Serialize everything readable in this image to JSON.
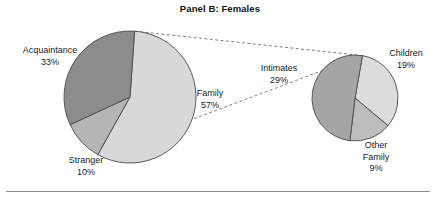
{
  "figure": {
    "title": "Panel B: Females",
    "background": "#ffffff",
    "has_bottom_rule": true
  },
  "chart_data": {
    "type": "pie",
    "title": "Panel B: Females",
    "subtitle": "",
    "xlabel": "",
    "ylabel": "",
    "legend_position": "none",
    "grid": false,
    "charts": [
      {
        "name": "main-pie",
        "role": "overall relationship distribution",
        "center": [
          130,
          97
        ],
        "radius": 66,
        "start_angle_deg": -86,
        "direction": "clockwise",
        "labels": [
          "Family",
          "Stranger",
          "Acquaintance"
        ],
        "values": [
          57,
          10,
          33
        ],
        "units": "%",
        "colors": [
          "#d8d8d8",
          "#b5b5b5",
          "#8c8c8c"
        ],
        "slices": [
          {
            "label": "Family",
            "value": 57,
            "display": "57%",
            "color": "#d8d8d8"
          },
          {
            "label": "Stranger",
            "value": 10,
            "display": "10%",
            "color": "#b5b5b5"
          },
          {
            "label": "Acquaintance",
            "value": 33,
            "display": "33%",
            "color": "#8c8c8c"
          }
        ]
      },
      {
        "name": "family-breakout-pie",
        "role": "breakdown of the Family slice (57%)",
        "center": [
          355,
          98
        ],
        "radius": 43,
        "start_angle_deg": -80,
        "direction": "clockwise",
        "labels": [
          "Children",
          "Other Family",
          "Intimates"
        ],
        "values": [
          19,
          9,
          29
        ],
        "units": "%",
        "colors": [
          "#dcdcdc",
          "#bdbdbd",
          "#a5a5a5"
        ],
        "slices": [
          {
            "label": "Children",
            "value": 19,
            "display": "19%",
            "color": "#dcdcdc"
          },
          {
            "label": "Other Family",
            "value": 9,
            "display": "9%",
            "color": "#bdbdbd"
          },
          {
            "label": "Intimates",
            "value": 29,
            "display": "29%",
            "color": "#a5a5a5"
          }
        ]
      }
    ],
    "connector": {
      "style": "dashed",
      "from_chart": "main-pie",
      "from_slice": "Family",
      "to_chart": "family-breakout-pie",
      "color": "#6e6e6e"
    }
  },
  "labels": {
    "acquaintance": {
      "name": "Acquaintance",
      "pct": "33%"
    },
    "family": {
      "name": "Family",
      "pct": "57%"
    },
    "stranger": {
      "name": "Stranger",
      "pct": "10%"
    },
    "intimates": {
      "name": "Intimates",
      "pct": "29%"
    },
    "children": {
      "name": "Children",
      "pct": "19%"
    },
    "other_family": {
      "name_line1": "Other",
      "name_line2": "Family",
      "pct": "9%"
    }
  }
}
